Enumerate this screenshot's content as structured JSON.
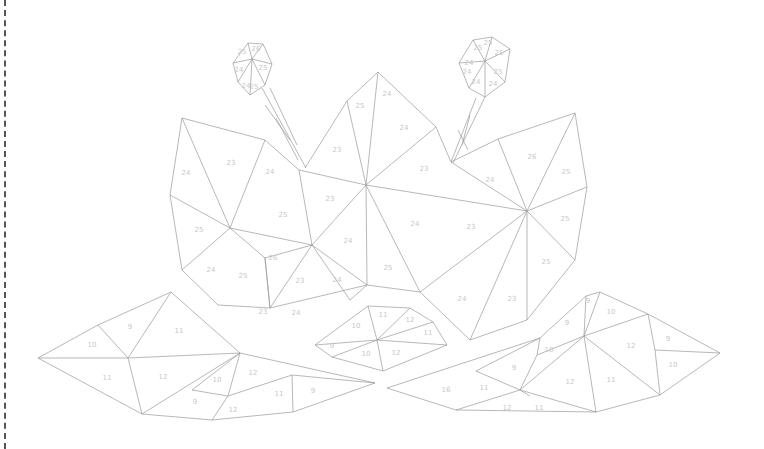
{
  "colors": {
    "line": "#9a9a9a",
    "label": "#c8c8c8",
    "background": "#ffffff",
    "border": "#555555"
  },
  "lines": [
    [
      [
        233,
        63
      ],
      [
        248,
        43
      ],
      [
        263,
        44
      ],
      [
        272,
        64
      ],
      [
        265,
        85
      ],
      [
        250,
        95
      ],
      [
        238,
        82
      ],
      [
        233,
        63
      ]
    ],
    [
      [
        252,
        59
      ],
      [
        248,
        43
      ]
    ],
    [
      [
        252,
        59
      ],
      [
        263,
        44
      ]
    ],
    [
      [
        252,
        59
      ],
      [
        272,
        64
      ]
    ],
    [
      [
        252,
        59
      ],
      [
        265,
        85
      ]
    ],
    [
      [
        252,
        59
      ],
      [
        250,
        95
      ]
    ],
    [
      [
        252,
        59
      ],
      [
        238,
        82
      ]
    ],
    [
      [
        252,
        59
      ],
      [
        233,
        63
      ]
    ],
    [
      [
        459,
        63
      ],
      [
        473,
        40
      ],
      [
        492,
        37
      ],
      [
        510,
        49
      ],
      [
        505,
        82
      ],
      [
        485,
        97
      ],
      [
        469,
        88
      ],
      [
        459,
        63
      ]
    ],
    [
      [
        485,
        61
      ],
      [
        473,
        40
      ]
    ],
    [
      [
        485,
        61
      ],
      [
        492,
        37
      ]
    ],
    [
      [
        485,
        61
      ],
      [
        510,
        49
      ]
    ],
    [
      [
        485,
        61
      ],
      [
        505,
        82
      ]
    ],
    [
      [
        485,
        61
      ],
      [
        485,
        97
      ]
    ],
    [
      [
        485,
        61
      ],
      [
        469,
        88
      ]
    ],
    [
      [
        485,
        61
      ],
      [
        459,
        63
      ]
    ],
    [
      [
        262,
        88
      ],
      [
        306,
        168
      ]
    ],
    [
      [
        270,
        88
      ],
      [
        297,
        145
      ]
    ],
    [
      [
        265,
        105
      ],
      [
        290,
        140
      ]
    ],
    [
      [
        276,
        118
      ],
      [
        298,
        160
      ]
    ],
    [
      [
        485,
        97
      ],
      [
        453,
        163
      ]
    ],
    [
      [
        476,
        98
      ],
      [
        451,
        162
      ]
    ],
    [
      [
        470,
        115
      ],
      [
        462,
        145
      ]
    ],
    [
      [
        458,
        130
      ],
      [
        468,
        150
      ]
    ],
    [
      [
        182,
        118
      ],
      [
        265,
        140
      ],
      [
        299,
        170
      ],
      [
        312,
        245
      ],
      [
        230,
        228
      ],
      [
        182,
        118
      ]
    ],
    [
      [
        182,
        118
      ],
      [
        170,
        195
      ],
      [
        230,
        228
      ]
    ],
    [
      [
        170,
        195
      ],
      [
        182,
        270
      ],
      [
        230,
        228
      ]
    ],
    [
      [
        182,
        270
      ],
      [
        218,
        305
      ],
      [
        270,
        308
      ],
      [
        265,
        258
      ],
      [
        230,
        228
      ]
    ],
    [
      [
        265,
        258
      ],
      [
        312,
        245
      ]
    ],
    [
      [
        265,
        140
      ],
      [
        230,
        228
      ]
    ],
    [
      [
        299,
        170
      ],
      [
        366,
        185
      ],
      [
        312,
        245
      ]
    ],
    [
      [
        305,
        168
      ],
      [
        347,
        101
      ],
      [
        378,
        72
      ],
      [
        436,
        127
      ],
      [
        451,
        162
      ],
      [
        527,
        211
      ],
      [
        366,
        185
      ]
    ],
    [
      [
        347,
        101
      ],
      [
        366,
        185
      ]
    ],
    [
      [
        378,
        72
      ],
      [
        366,
        185
      ]
    ],
    [
      [
        436,
        127
      ],
      [
        366,
        185
      ]
    ],
    [
      [
        366,
        185
      ],
      [
        367,
        285
      ],
      [
        312,
        245
      ]
    ],
    [
      [
        366,
        185
      ],
      [
        420,
        292
      ],
      [
        367,
        285
      ]
    ],
    [
      [
        265,
        258
      ],
      [
        270,
        308
      ],
      [
        367,
        285
      ]
    ],
    [
      [
        270,
        308
      ],
      [
        312,
        245
      ]
    ],
    [
      [
        312,
        245
      ],
      [
        350,
        300
      ],
      [
        367,
        285
      ]
    ],
    [
      [
        451,
        162
      ],
      [
        498,
        139
      ],
      [
        575,
        113
      ],
      [
        587,
        187
      ],
      [
        575,
        260
      ],
      [
        527,
        320
      ],
      [
        470,
        340
      ],
      [
        420,
        292
      ],
      [
        527,
        211
      ]
    ],
    [
      [
        498,
        139
      ],
      [
        527,
        211
      ]
    ],
    [
      [
        575,
        113
      ],
      [
        527,
        211
      ]
    ],
    [
      [
        587,
        187
      ],
      [
        527,
        211
      ]
    ],
    [
      [
        527,
        211
      ],
      [
        470,
        340
      ]
    ],
    [
      [
        527,
        211
      ],
      [
        527,
        320
      ]
    ],
    [
      [
        527,
        211
      ],
      [
        575,
        260
      ]
    ],
    [
      [
        38,
        358
      ],
      [
        98,
        325
      ],
      [
        171,
        292
      ],
      [
        240,
        353
      ],
      [
        142,
        414
      ],
      [
        38,
        358
      ]
    ],
    [
      [
        98,
        325
      ],
      [
        128,
        358
      ],
      [
        171,
        292
      ]
    ],
    [
      [
        38,
        358
      ],
      [
        128,
        358
      ],
      [
        240,
        353
      ]
    ],
    [
      [
        128,
        358
      ],
      [
        142,
        414
      ]
    ],
    [
      [
        240,
        353
      ],
      [
        375,
        383
      ],
      [
        293,
        412
      ],
      [
        212,
        420
      ],
      [
        142,
        414
      ]
    ],
    [
      [
        240,
        353
      ],
      [
        228,
        396
      ],
      [
        212,
        420
      ]
    ],
    [
      [
        192,
        390
      ],
      [
        228,
        396
      ],
      [
        292,
        375
      ],
      [
        293,
        412
      ]
    ],
    [
      [
        292,
        375
      ],
      [
        375,
        383
      ]
    ],
    [
      [
        192,
        390
      ],
      [
        240,
        353
      ]
    ],
    [
      [
        315,
        345
      ],
      [
        368,
        306
      ],
      [
        410,
        308
      ],
      [
        433,
        322
      ],
      [
        447,
        345
      ],
      [
        383,
        371
      ],
      [
        332,
        357
      ],
      [
        315,
        345
      ]
    ],
    [
      [
        315,
        345
      ],
      [
        377,
        340
      ],
      [
        368,
        306
      ]
    ],
    [
      [
        377,
        340
      ],
      [
        410,
        308
      ]
    ],
    [
      [
        377,
        340
      ],
      [
        433,
        322
      ]
    ],
    [
      [
        377,
        340
      ],
      [
        447,
        345
      ]
    ],
    [
      [
        377,
        340
      ],
      [
        383,
        371
      ]
    ],
    [
      [
        377,
        340
      ],
      [
        332,
        357
      ]
    ],
    [
      [
        387,
        388
      ],
      [
        540,
        338
      ],
      [
        586,
        296
      ],
      [
        600,
        292
      ],
      [
        648,
        314
      ],
      [
        720,
        353
      ],
      [
        660,
        395
      ],
      [
        596,
        412
      ],
      [
        456,
        410
      ],
      [
        387,
        388
      ]
    ],
    [
      [
        540,
        338
      ],
      [
        537,
        355
      ],
      [
        520,
        390
      ],
      [
        596,
        412
      ]
    ],
    [
      [
        537,
        355
      ],
      [
        584,
        336
      ],
      [
        586,
        296
      ]
    ],
    [
      [
        584,
        336
      ],
      [
        600,
        292
      ]
    ],
    [
      [
        584,
        336
      ],
      [
        648,
        314
      ]
    ],
    [
      [
        584,
        336
      ],
      [
        660,
        395
      ]
    ],
    [
      [
        584,
        336
      ],
      [
        596,
        412
      ]
    ],
    [
      [
        584,
        336
      ],
      [
        520,
        390
      ]
    ],
    [
      [
        648,
        314
      ],
      [
        655,
        350
      ],
      [
        720,
        353
      ]
    ],
    [
      [
        655,
        350
      ],
      [
        660,
        395
      ]
    ],
    [
      [
        476,
        371
      ],
      [
        520,
        390
      ],
      [
        456,
        410
      ]
    ],
    [
      [
        476,
        371
      ],
      [
        540,
        338
      ]
    ],
    [
      [
        530,
        396
      ],
      [
        520,
        390
      ]
    ]
  ],
  "labels": [
    {
      "t": "25",
      "x": 242,
      "y": 52
    },
    {
      "t": "26",
      "x": 256,
      "y": 49
    },
    {
      "t": "24",
      "x": 239,
      "y": 70
    },
    {
      "t": "25",
      "x": 263,
      "y": 68
    },
    {
      "t": "24",
      "x": 246,
      "y": 86
    },
    {
      "t": "25",
      "x": 254,
      "y": 87
    },
    {
      "t": "25",
      "x": 478,
      "y": 48
    },
    {
      "t": "25",
      "x": 488,
      "y": 43
    },
    {
      "t": "24",
      "x": 469,
      "y": 63
    },
    {
      "t": "25",
      "x": 499,
      "y": 53
    },
    {
      "t": "24",
      "x": 467,
      "y": 72
    },
    {
      "t": "25",
      "x": 498,
      "y": 72
    },
    {
      "t": "24",
      "x": 476,
      "y": 82
    },
    {
      "t": "24",
      "x": 493,
      "y": 84
    },
    {
      "t": "24",
      "x": 186,
      "y": 173
    },
    {
      "t": "23",
      "x": 231,
      "y": 163
    },
    {
      "t": "24",
      "x": 270,
      "y": 172
    },
    {
      "t": "25",
      "x": 199,
      "y": 230
    },
    {
      "t": "25",
      "x": 283,
      "y": 215
    },
    {
      "t": "24",
      "x": 211,
      "y": 270
    },
    {
      "t": "25",
      "x": 243,
      "y": 276
    },
    {
      "t": "26",
      "x": 273,
      "y": 258
    },
    {
      "t": "23",
      "x": 300,
      "y": 281
    },
    {
      "t": "24",
      "x": 337,
      "y": 280
    },
    {
      "t": "23",
      "x": 263,
      "y": 312
    },
    {
      "t": "24",
      "x": 296,
      "y": 313
    },
    {
      "t": "23",
      "x": 337,
      "y": 150
    },
    {
      "t": "25",
      "x": 360,
      "y": 106
    },
    {
      "t": "24",
      "x": 387,
      "y": 94
    },
    {
      "t": "24",
      "x": 404,
      "y": 128
    },
    {
      "t": "23",
      "x": 424,
      "y": 169
    },
    {
      "t": "23",
      "x": 330,
      "y": 199
    },
    {
      "t": "24",
      "x": 348,
      "y": 241
    },
    {
      "t": "24",
      "x": 415,
      "y": 224
    },
    {
      "t": "25",
      "x": 388,
      "y": 268
    },
    {
      "t": "26",
      "x": 532,
      "y": 157
    },
    {
      "t": "25",
      "x": 566,
      "y": 172
    },
    {
      "t": "24",
      "x": 490,
      "y": 180
    },
    {
      "t": "25",
      "x": 565,
      "y": 219
    },
    {
      "t": "23",
      "x": 471,
      "y": 227
    },
    {
      "t": "25",
      "x": 546,
      "y": 262
    },
    {
      "t": "24",
      "x": 462,
      "y": 299
    },
    {
      "t": "23",
      "x": 512,
      "y": 299
    },
    {
      "t": "9",
      "x": 130,
      "y": 327
    },
    {
      "t": "10",
      "x": 92,
      "y": 345
    },
    {
      "t": "11",
      "x": 179,
      "y": 331
    },
    {
      "t": "11",
      "x": 107,
      "y": 378
    },
    {
      "t": "12",
      "x": 163,
      "y": 377
    },
    {
      "t": "10",
      "x": 217,
      "y": 380
    },
    {
      "t": "9",
      "x": 195,
      "y": 402
    },
    {
      "t": "12",
      "x": 253,
      "y": 373
    },
    {
      "t": "12",
      "x": 233,
      "y": 410
    },
    {
      "t": "11",
      "x": 279,
      "y": 394
    },
    {
      "t": "9",
      "x": 313,
      "y": 391
    },
    {
      "t": "10",
      "x": 356,
      "y": 326
    },
    {
      "t": "11",
      "x": 383,
      "y": 315
    },
    {
      "t": "12",
      "x": 410,
      "y": 320
    },
    {
      "t": "11",
      "x": 428,
      "y": 333
    },
    {
      "t": "9",
      "x": 332,
      "y": 346
    },
    {
      "t": "10",
      "x": 366,
      "y": 354
    },
    {
      "t": "12",
      "x": 396,
      "y": 353
    },
    {
      "t": "9",
      "x": 588,
      "y": 301
    },
    {
      "t": "10",
      "x": 611,
      "y": 312
    },
    {
      "t": "9",
      "x": 567,
      "y": 323
    },
    {
      "t": "12",
      "x": 631,
      "y": 346
    },
    {
      "t": "9",
      "x": 668,
      "y": 339
    },
    {
      "t": "10",
      "x": 549,
      "y": 350
    },
    {
      "t": "9",
      "x": 514,
      "y": 368
    },
    {
      "t": "10",
      "x": 673,
      "y": 365
    },
    {
      "t": "12",
      "x": 570,
      "y": 382
    },
    {
      "t": "11",
      "x": 611,
      "y": 380
    },
    {
      "t": "16",
      "x": 446,
      "y": 390
    },
    {
      "t": "11",
      "x": 484,
      "y": 388
    },
    {
      "t": "12",
      "x": 507,
      "y": 408
    },
    {
      "t": "11",
      "x": 539,
      "y": 408
    }
  ]
}
